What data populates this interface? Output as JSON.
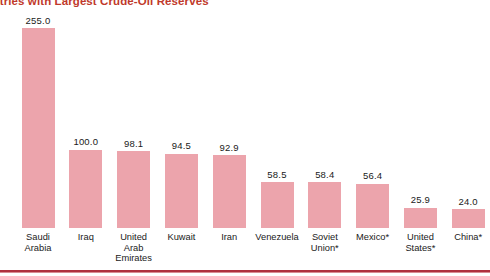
{
  "chart_data": {
    "type": "bar",
    "title": "Countries with Largest Crude-Oil Reserves",
    "title_visible_fragment": "es with Largest Crude-Oil Reserves",
    "xlabel": "",
    "ylabel": "",
    "ylim": [
      0,
      255
    ],
    "grid": false,
    "legend": null,
    "bar_color": "#eca4ac",
    "title_color": "#c0392b",
    "rule_color": "#b0303f",
    "categories": [
      "Saudi\nArabia",
      "Iraq",
      "United\nArab\nEmirates",
      "Kuwait",
      "Iran",
      "Venezuela",
      "Soviet\nUnion*",
      "Mexico*",
      "United\nStates*",
      "China*"
    ],
    "values": [
      255.0,
      100.0,
      98.1,
      94.5,
      92.9,
      58.5,
      58.4,
      56.4,
      25.9,
      24.0
    ],
    "value_labels": [
      "255.0",
      "100.0",
      "98.1",
      "94.5",
      "92.9",
      "58.5",
      "58.4",
      "56.4",
      "25.9",
      "24.0"
    ]
  }
}
